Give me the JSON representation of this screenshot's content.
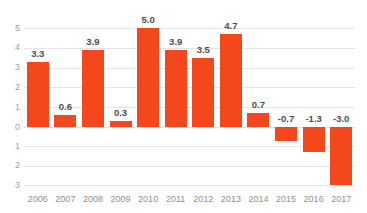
{
  "chart_data": {
    "type": "bar",
    "title": "",
    "subtitle": "",
    "xlabel": "",
    "ylabel": "",
    "categories": [
      "2006",
      "2007",
      "2008",
      "2009",
      "2010",
      "2011",
      "2012",
      "2013",
      "2014",
      "2015",
      "2016",
      "2017"
    ],
    "values": [
      3.3,
      0.6,
      3.9,
      0.3,
      5.0,
      3.9,
      3.5,
      4.7,
      0.7,
      -0.7,
      -1.3,
      -3.0
    ],
    "data_labels": [
      "3.3",
      "0.6",
      "3.9",
      "0.3",
      "5.0",
      "3.9",
      "3.5",
      "4.7",
      "0.7",
      "-0.7",
      "-1.3",
      "-3.0"
    ],
    "ylim": [
      -3,
      5
    ],
    "y_ticks": [
      5,
      4,
      3,
      2,
      1,
      0,
      -1,
      -2,
      -3
    ],
    "y_tick_labels": [
      "5",
      "4",
      "3",
      "2",
      "1",
      "0",
      "1",
      "2",
      "3"
    ],
    "grid": true,
    "legend": false,
    "legend_position": "none",
    "bar_color": "#f4471c",
    "gridline_color": "#e4e4e4",
    "axis_label_color": "#a0a0a0",
    "data_label_color": "#4d4d4d",
    "background_color": "#ffffff"
  }
}
